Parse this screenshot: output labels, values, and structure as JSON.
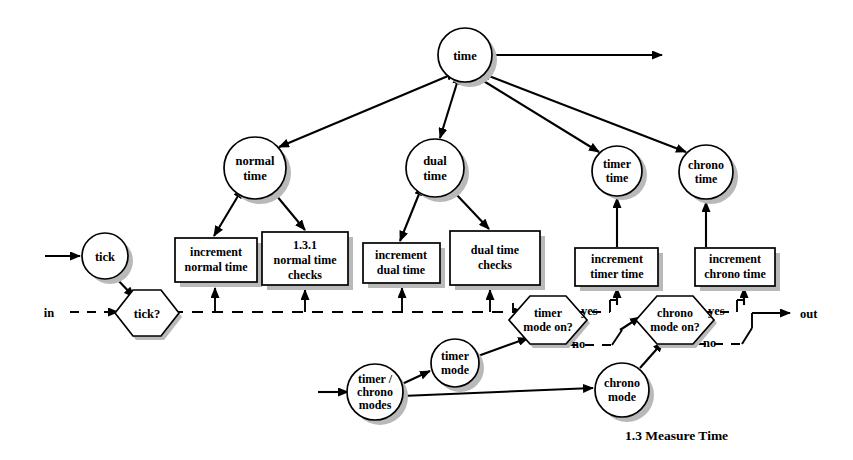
{
  "diagram": {
    "caption": "1.3 Measure Time",
    "io": {
      "in_label": "in",
      "out_label": "out"
    },
    "nodes": {
      "time": {
        "label_line1": "time"
      },
      "normal_time": {
        "label_line1": "normal",
        "label_line2": "time"
      },
      "dual_time": {
        "label_line1": "dual",
        "label_line2": "time"
      },
      "timer_time": {
        "label_line1": "timer",
        "label_line2": "time"
      },
      "chrono_time": {
        "label_line1": "chrono",
        "label_line2": "time"
      },
      "tick": {
        "label_line1": "tick"
      },
      "timer_chrono_modes": {
        "label_line1": "timer /",
        "label_line2": "chrono",
        "label_line3": "modes"
      },
      "timer_mode": {
        "label_line1": "timer",
        "label_line2": "mode"
      },
      "chrono_mode": {
        "label_line1": "chrono",
        "label_line2": "mode"
      }
    },
    "processes": {
      "increment_normal_time": {
        "label_line1": "increment",
        "label_line2": "normal time"
      },
      "normal_time_checks": {
        "label_line1": "1.3.1",
        "label_line2": "normal time",
        "label_line3": "checks"
      },
      "increment_dual_time": {
        "label_line1": "increment",
        "label_line2": "dual time"
      },
      "dual_time_checks": {
        "label_line1": "dual  time",
        "label_line2": "checks"
      },
      "increment_timer_time": {
        "label_line1": "increment",
        "label_line2": "timer time"
      },
      "increment_chrono_time": {
        "label_line1": "increment",
        "label_line2": "chrono time"
      }
    },
    "decisions": {
      "tick_q": {
        "label_line1": "tick?"
      },
      "timer_mode_on_q": {
        "label_line1": "timer",
        "label_line2": "mode on?",
        "yes_label": "yes",
        "no_label": "no"
      },
      "chrono_mode_on_q": {
        "label_line1": "chrono",
        "label_line2": "mode on?",
        "yes_label": "yes",
        "no_label": "no"
      }
    },
    "colors": {
      "stroke": "#000000",
      "fill": "#ffffff",
      "shadow": "#b9b9b9"
    }
  }
}
